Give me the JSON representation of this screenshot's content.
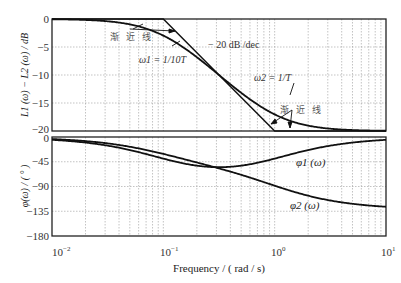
{
  "chart_data": [
    {
      "type": "line",
      "title": "",
      "xscale": "log",
      "xlabel": "Frequency / ( rad / s)",
      "ylabel": "L1(ω) − L2(ω) / dB",
      "xlim": [
        0.01,
        10
      ],
      "ylim": [
        -20,
        0
      ],
      "grid": true,
      "x_tick_labels": [
        "10^-2",
        "10^-1",
        "10^0",
        "10^1"
      ],
      "y_ticks": [
        0,
        -5,
        -10,
        -15,
        -20
      ],
      "series": [
        {
          "name": "magnitude (actual)",
          "x": [
            0.01,
            0.02,
            0.05,
            0.1,
            0.2,
            0.316,
            0.5,
            1,
            2,
            5,
            10
          ],
          "y": [
            -0.04,
            -0.17,
            -0.9,
            -2.96,
            -6.9,
            -10.0,
            -13.0,
            -17.0,
            -19.2,
            -19.9,
            -20.0
          ]
        },
        {
          "name": "asymptote",
          "x": [
            0.01,
            0.1,
            1,
            10
          ],
          "y": [
            0,
            0,
            -20,
            -20
          ]
        }
      ],
      "annotations": [
        "渐近线",
        "ω1 = 1/10T",
        "−20 dB/dec",
        "ω2 = 1/T",
        "渐近线"
      ]
    },
    {
      "type": "line",
      "title": "",
      "xscale": "log",
      "xlabel": "Frequency / ( rad / s)",
      "ylabel": "φ(ω) / (°)",
      "xlim": [
        0.01,
        10
      ],
      "ylim": [
        -180,
        0
      ],
      "grid": true,
      "x_tick_labels": [
        "10^-2",
        "10^-1",
        "10^0",
        "10^1"
      ],
      "y_ticks": [
        0,
        -45,
        -90,
        -135,
        -180
      ],
      "series": [
        {
          "name": "φ1(ω)",
          "x": [
            0.01,
            0.02,
            0.05,
            0.1,
            0.2,
            0.316,
            0.5,
            1,
            2,
            5,
            10
          ],
          "y": [
            -5.1,
            -10.1,
            -23.9,
            -39.3,
            -52.0,
            -54.9,
            -52.0,
            -39.3,
            -23.9,
            -10.1,
            -5.1
          ]
        },
        {
          "name": "φ2(ω)",
          "x": [
            0.01,
            0.02,
            0.05,
            0.1,
            0.2,
            0.316,
            0.5,
            1,
            2,
            5,
            10
          ],
          "y": [
            -5.7,
            -11.4,
            -26.9,
            -45.3,
            -63.4,
            -78.7,
            -90.0,
            -129.3,
            -153.4,
            -168.7,
            -174.3
          ]
        }
      ],
      "annotations": [
        "φ1 (ω)",
        "φ2 (ω)"
      ]
    }
  ],
  "labels": {
    "xlabel": "Frequency / ( rad / s)",
    "upper_ylabel_main": "L",
    "upper_ylabel_full": "L1 (ω) − L2 (ω) / dB",
    "lower_ylabel_full": "φ(ω) / ( ° )",
    "asym1": "渐 近 线",
    "asym2": "渐 近 线",
    "w1": "ω1 = 1/10T",
    "slope": "− 20 dB /dec",
    "w2": "ω2 = 1/T",
    "phi1": "φ1 (ω)",
    "phi2": "φ2 (ω)",
    "yt_up": [
      "0",
      "−5",
      "−10",
      "−15",
      "−20"
    ],
    "yt_lo": [
      "0",
      "−45",
      "−90",
      "−135",
      "−180"
    ],
    "xt": [
      "10",
      "10",
      "10",
      "10"
    ],
    "xt_exp": [
      "−2",
      "−1",
      "0",
      "1"
    ]
  }
}
